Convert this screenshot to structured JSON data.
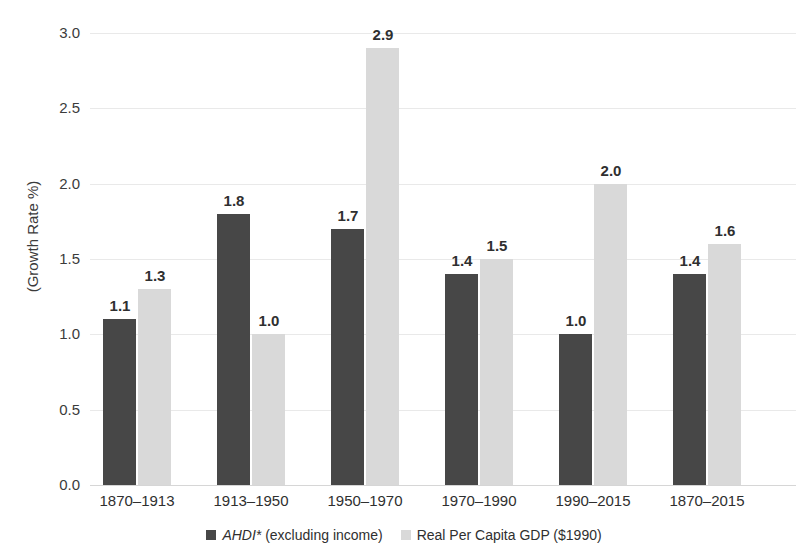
{
  "chart_data": {
    "type": "bar",
    "title": "",
    "xlabel": "",
    "ylabel": "(Growth Rate %)",
    "ylim": [
      0,
      3.0
    ],
    "ytick_step": 0.5,
    "grid": true,
    "legend_position": "bottom",
    "categories": [
      "1870–1913",
      "1913–1950",
      "1950–1970",
      "1970–1990",
      "1990–2015",
      "1870–2015"
    ],
    "yticks": [
      "0.0",
      "0.5",
      "1.0",
      "1.5",
      "2.0",
      "2.5",
      "3.0"
    ],
    "series": [
      {
        "name": "AHDI* (excluding income)",
        "name_italic_part": "AHDI*",
        "name_plain_part": "(excluding income)",
        "color": "#474747",
        "values": [
          1.1,
          1.8,
          1.7,
          1.4,
          1.0,
          1.4
        ],
        "labels": [
          "1.1",
          "1.8",
          "1.7",
          "1.4",
          "1.0",
          "1.4"
        ]
      },
      {
        "name": "Real Per Capita GDP ($1990)",
        "color": "#d9d9d9",
        "values": [
          1.3,
          1.0,
          2.9,
          1.5,
          2.0,
          1.6
        ],
        "labels": [
          "1.3",
          "1.0",
          "2.9",
          "1.5",
          "2.0",
          "1.6"
        ]
      }
    ]
  },
  "axis": {
    "y_label": "(Growth Rate %)"
  },
  "legend": {
    "item1_italic": "AHDI*",
    "item1_rest": "(excluding income)",
    "item2": "Real Per Capita GDP ($1990)"
  }
}
